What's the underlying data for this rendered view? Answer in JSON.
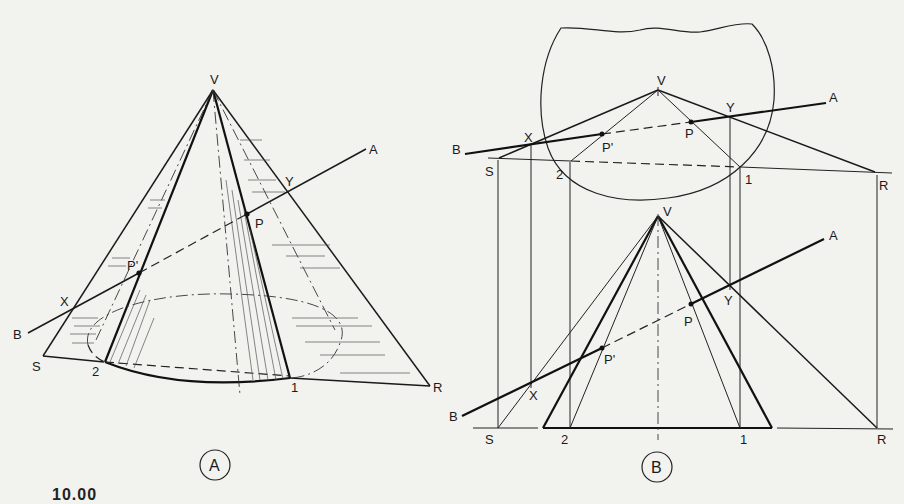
{
  "figure": {
    "caption_fragment": "10.00",
    "background_color": "#f2f2ef",
    "line_color": "#1a1a1a"
  },
  "view_a": {
    "badge": "A",
    "labels": {
      "vertex": "V",
      "line_end_a": "A",
      "line_end_b": "B",
      "point_x": "X",
      "point_y": "Y",
      "point_p": "P",
      "point_p_prime": "P'",
      "base_s": "S",
      "base_r": "R",
      "base_1": "1",
      "base_2": "2"
    }
  },
  "view_b": {
    "badge": "B",
    "top_view_labels": {
      "vertex": "V",
      "line_end_a": "A",
      "line_end_b": "B",
      "point_x": "X",
      "point_y": "Y",
      "point_p": "P",
      "point_p_prime": "P'",
      "base_s": "S",
      "base_r": "R",
      "base_1": "1",
      "base_2": "2"
    },
    "front_view_labels": {
      "vertex": "V",
      "line_end_a": "A",
      "line_end_b": "B",
      "point_x": "X",
      "point_y": "Y",
      "point_p": "P",
      "point_p_prime": "P'",
      "base_s": "S",
      "base_r": "R",
      "base_1": "1",
      "base_2": "2"
    }
  }
}
